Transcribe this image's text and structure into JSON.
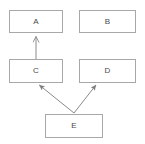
{
  "diagram": {
    "type": "class-hierarchy-diagram",
    "background_color": "#ffffff",
    "box_border_color": "#a8a8a8",
    "label_color": "#4a4a4a",
    "edge_color": "#8a8a8a",
    "nodes": [
      {
        "id": "A",
        "label": "A",
        "x": 9,
        "y": 10,
        "w": 54,
        "h": 23
      },
      {
        "id": "B",
        "label": "B",
        "x": 79,
        "y": 10,
        "w": 57,
        "h": 23
      },
      {
        "id": "C",
        "label": "C",
        "x": 9,
        "y": 59,
        "w": 54,
        "h": 24
      },
      {
        "id": "D",
        "label": "D",
        "x": 79,
        "y": 59,
        "w": 57,
        "h": 24
      },
      {
        "id": "E",
        "label": "E",
        "x": 45,
        "y": 114,
        "w": 58,
        "h": 24
      }
    ],
    "edges": [
      {
        "id": "C-to-A",
        "from": "C",
        "to": "A",
        "arrowhead": "open-triangle",
        "x1": 36,
        "y1": 59,
        "x2": 36,
        "y2": 34
      },
      {
        "id": "E-to-C",
        "from": "E",
        "to": "C",
        "arrowhead": "filled",
        "x1": 74,
        "y1": 113,
        "x2": 38,
        "y2": 84
      },
      {
        "id": "E-to-D",
        "from": "E",
        "to": "D",
        "arrowhead": "filled",
        "x1": 74,
        "y1": 113,
        "x2": 97,
        "y2": 84
      }
    ]
  }
}
